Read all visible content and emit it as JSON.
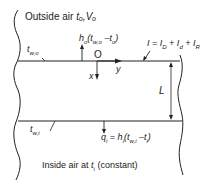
{
  "diagram": {
    "outside_label": "Outside air t_o, V_o",
    "outside_text": "Outside air",
    "outside_vars": "tₒ,Vₒ",
    "outer_wall_temp": "tᵤ,ₒ",
    "outer_conv": "hₒ(tᵤ,ₒ –tₒ)",
    "origin": "O",
    "x_axis": "x",
    "y_axis": "y",
    "irradiance": "I = Iᴅ + Iᴅ + Iᴿ",
    "irradiance_display": "I = I_D + I_d + I_R",
    "thickness": "L",
    "inner_wall_temp": "tᵤ,ᵢ",
    "inner_flux": "qᵢ = hᵢ(tᵤ,ᵢ –tᵢ)",
    "inside_label": "Inside air at tᵢ (constant)",
    "inside_text": "Inside air at",
    "inside_var": "tᵢ",
    "inside_note": "(constant)"
  },
  "labels": {
    "outside": "Outside air tₒ,Vₒ",
    "tw_o": "t",
    "tw_o_sub": "w,o",
    "ho_expr": "h",
    "ho_sub": "o",
    "ho_rest": "(t",
    "ho_rest_sub": "w,o",
    "ho_tail": " –t",
    "ho_tail_sub": "o",
    "ho_close": ")",
    "origin": "O",
    "x": "x",
    "y": "y",
    "I_main": "I = I",
    "I_D": "D",
    "I_plus1": " + I",
    "I_d": "d",
    "I_plus2": " + I",
    "I_R": "R",
    "L": "L",
    "tw_i": "t",
    "tw_i_sub": "w,i",
    "qi": "q",
    "qi_sub": "i",
    "qi_eq": " = h",
    "qi_h_sub": "i",
    "qi_rest": "(t",
    "qi_rest_sub": "w,i",
    "qi_tail": " –t",
    "qi_tail_sub": "i",
    "qi_close": ")",
    "inside_a": "Inside air at ",
    "inside_t": "t",
    "inside_t_sub": "i",
    "inside_b": " (constant)"
  }
}
